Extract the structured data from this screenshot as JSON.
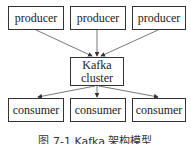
{
  "diagram": {
    "producers": [
      {
        "label": "producer"
      },
      {
        "label": "producer"
      },
      {
        "label": "producer"
      }
    ],
    "broker": {
      "line1": "Kafka",
      "line2": "cluster"
    },
    "consumers": [
      {
        "label": "consumer"
      },
      {
        "label": "consumer"
      },
      {
        "label": "consumer"
      }
    ],
    "caption": "图 7-1 Kafka 架构模型"
  }
}
